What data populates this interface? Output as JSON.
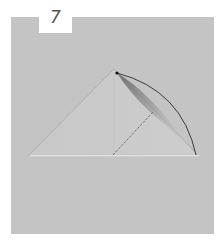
{
  "step": {
    "number": "7"
  },
  "colors": {
    "background": "#ffffff",
    "panel": "#c4c4c4",
    "paper": "#c9c9c9",
    "paper_edge": "#a3a3a3",
    "base_highlight": "#e2e2e2",
    "arrow": "#2b2b2b",
    "dashed_line": "#6f6f6f",
    "badge_text": "#555555"
  },
  "illustration": {
    "subject": "folded paper triangle",
    "apex": [
      114,
      69
    ],
    "base_left": [
      29,
      155
    ],
    "base_right": [
      198,
      155
    ],
    "fold_arrow": {
      "from": [
        117,
        73
      ],
      "to": [
        196,
        155
      ],
      "type": "arc"
    },
    "valley_fold_line": {
      "from": [
        113,
        155
      ],
      "to": [
        153,
        112
      ],
      "style": "dashed"
    }
  }
}
